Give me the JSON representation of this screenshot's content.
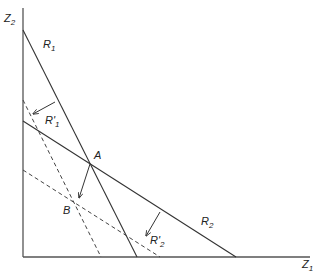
{
  "diagram": {
    "axes": {
      "x_label": "Z",
      "x_sub": "1",
      "y_label": "Z",
      "y_sub": "2"
    },
    "lines": {
      "R1": {
        "label": "R",
        "sub": "1",
        "style": "solid"
      },
      "R2": {
        "label": "R",
        "sub": "2",
        "style": "solid"
      },
      "R1_prime": {
        "label": "R'",
        "sub": "1",
        "style": "dashed"
      },
      "R2_prime": {
        "label": "R'",
        "sub": "2",
        "style": "dashed"
      }
    },
    "points": {
      "A": {
        "label": "A"
      },
      "B": {
        "label": "B"
      }
    },
    "colors": {
      "line": "#333333",
      "axis": "#555555",
      "background": "#ffffff"
    }
  }
}
